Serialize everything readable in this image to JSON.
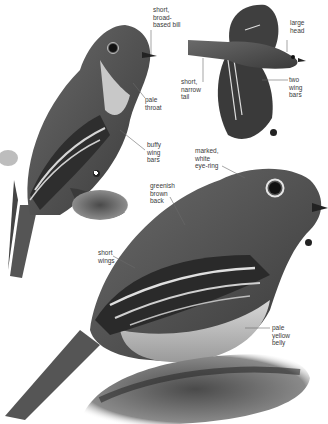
{
  "page": {
    "palette": {
      "background": "#ffffff",
      "bird_dark": "#3b3b3b",
      "bird_mid": "#6e6e6e",
      "bird_light": "#b8b8b8",
      "label_text": "#3a3a3a",
      "leader_line": "#6a6a6a"
    }
  },
  "figures": {
    "perched_left": {
      "labels": [
        {
          "id": "bill",
          "text": "short,\nbroad-\nbased bill"
        },
        {
          "id": "throat",
          "text": "pale\nthroat"
        },
        {
          "id": "wingbars",
          "text": "buffy\nwing\nbars"
        }
      ],
      "marker_icon": "juvenile-symbol-icon"
    },
    "flight_top": {
      "labels": [
        {
          "id": "head",
          "text": "large\nhead"
        },
        {
          "id": "tail",
          "text": "short,\nnarrow\ntail"
        },
        {
          "id": "wingbars",
          "text": "two\nwing\nbars"
        }
      ],
      "marker_icon": "adult-symbol-icon"
    },
    "perched_main": {
      "labels": [
        {
          "id": "eyering",
          "text": "marked,\nwhite\neye-ring"
        },
        {
          "id": "back",
          "text": "greenish\nbrown\nback"
        },
        {
          "id": "wings",
          "text": "short\nwings"
        },
        {
          "id": "belly",
          "text": "pale\nyellow\nbelly"
        }
      ],
      "marker_icon": "adult-symbol-icon"
    }
  }
}
